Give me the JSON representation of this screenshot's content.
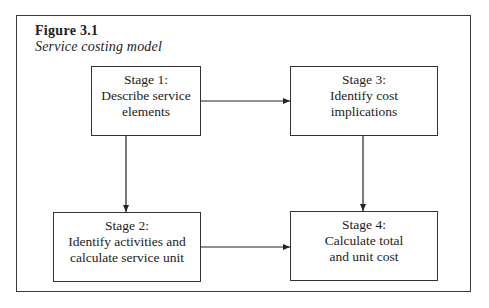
{
  "figure": {
    "label": "Figure 3.1",
    "title": "Service costing model"
  },
  "stages": [
    {
      "id": "stage1",
      "heading": "Stage 1:",
      "lines": [
        "Describe service",
        "elements"
      ]
    },
    {
      "id": "stage2",
      "heading": "Stage 2:",
      "lines": [
        "Identify activities and",
        "calculate service unit"
      ]
    },
    {
      "id": "stage3",
      "heading": "Stage 3:",
      "lines": [
        "Identify cost",
        "implications"
      ]
    },
    {
      "id": "stage4",
      "heading": "Stage 4:",
      "lines": [
        "Calculate total",
        "and unit cost"
      ]
    }
  ],
  "connections": [
    {
      "from": "stage1",
      "to": "stage3"
    },
    {
      "from": "stage1",
      "to": "stage2"
    },
    {
      "from": "stage3",
      "to": "stage4"
    },
    {
      "from": "stage2",
      "to": "stage4"
    }
  ]
}
